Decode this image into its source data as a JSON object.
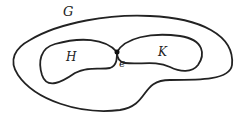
{
  "diagram": {
    "labels": {
      "outer": "G",
      "left_region": "H",
      "right_region": "K",
      "point": "e"
    },
    "colors": {
      "stroke": "#222222",
      "background": "#ffffff"
    }
  }
}
